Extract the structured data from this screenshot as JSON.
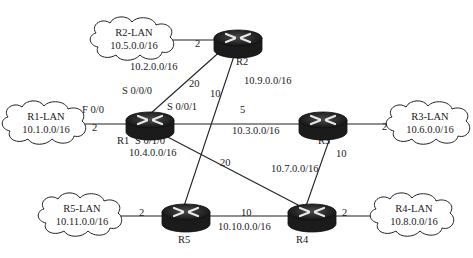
{
  "routers": [
    {
      "id": "R1",
      "label": "R1",
      "x": 150,
      "y": 122
    },
    {
      "id": "R2",
      "label": "R2",
      "x": 238,
      "y": 40
    },
    {
      "id": "R3",
      "label": "R3",
      "x": 322,
      "y": 122
    },
    {
      "id": "R4",
      "label": "R4",
      "x": 312,
      "y": 214
    },
    {
      "id": "R5",
      "label": "R5",
      "x": 186,
      "y": 214
    }
  ],
  "lans": [
    {
      "id": "R2-LAN",
      "name": "R2-LAN",
      "network": "10.5.0.0/16",
      "x": 135,
      "y": 39
    },
    {
      "id": "R1-LAN",
      "name": "R1-LAN",
      "network": "10.1.0.0/16",
      "x": 45,
      "y": 122
    },
    {
      "id": "R3-LAN",
      "name": "R3-LAN",
      "network": "10.6.0.0/16",
      "x": 430,
      "y": 122
    },
    {
      "id": "R5-LAN",
      "name": "R5-LAN",
      "network": "10.11.0.0/16",
      "x": 83,
      "y": 214
    },
    {
      "id": "R4-LAN",
      "name": "R4-LAN",
      "network": "10.8.0.0/16",
      "x": 415,
      "y": 214
    }
  ],
  "links": [
    {
      "from": "R2-LAN",
      "to": "R2",
      "cost": "2"
    },
    {
      "from": "R1-LAN",
      "to": "R1",
      "cost": "2",
      "interface": "F 0/0"
    },
    {
      "from": "R1",
      "to": "R2",
      "cost": "20",
      "network": "10.2.0.0/16",
      "interface": "S 0/0/0"
    },
    {
      "from": "R1",
      "to": "R3",
      "cost": "5",
      "network": "10.3.0.0/16",
      "interface": "S 0/0/1"
    },
    {
      "from": "R1",
      "to": "R4",
      "cost": "20",
      "network": "10.4.0.0/16",
      "interface": "S 0/1/0"
    },
    {
      "from": "R2",
      "to": "R5",
      "cost": "10",
      "network": "10.9.0.0/16"
    },
    {
      "from": "R3",
      "to": "R3-LAN",
      "cost": "2"
    },
    {
      "from": "R3",
      "to": "R4",
      "cost": "10",
      "network": "10.7.0.0/16"
    },
    {
      "from": "R5",
      "to": "R4",
      "cost": "10",
      "network": "10.10.0.0/16"
    },
    {
      "from": "R5-LAN",
      "to": "R5",
      "cost": "2"
    },
    {
      "from": "R4",
      "to": "R4-LAN",
      "cost": "2"
    }
  ],
  "labels": {
    "r2lan_cost": "2",
    "r1lan_cost": "2",
    "r1_f00": "F 0/0",
    "r1_s000": "S 0/0/0",
    "r1_s001": "S 0/0/1",
    "r1_s010": "S 0/1/0",
    "net_r1r2": "10.2.0.0/16",
    "cost_r1r2": "20",
    "net_r2r5": "10.9.0.0/16",
    "cost_r2r5": "10",
    "net_r1r3": "10.3.0.0/16",
    "cost_r1r3": "5",
    "net_r1r4": "10.4.0.0/16",
    "cost_r1r4": "20",
    "net_r3r4": "10.7.0.0/16",
    "cost_r3r4": "10",
    "net_r5r4": "10.10.0.0/16",
    "cost_r5r4": "10",
    "r3lan_cost": "2",
    "r5lan_cost": "2",
    "r4lan_cost": "2"
  }
}
